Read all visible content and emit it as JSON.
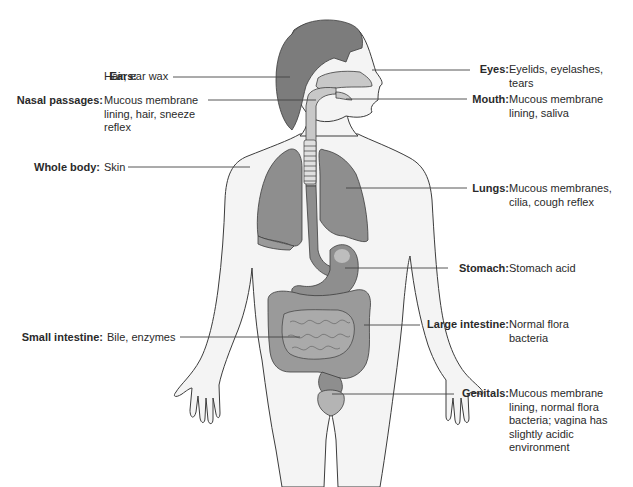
{
  "diagram": {
    "colors": {
      "skin": "#f4f4f4",
      "outline": "#3c3c3c",
      "hair": "#7c7c7c",
      "organ": "#8e8e8e",
      "airway": "#c8c8c8",
      "leader": "#444444"
    },
    "labels": {
      "ears": {
        "term": "Ears:",
        "desc": "Hair, ear wax"
      },
      "nasal": {
        "term": "Nasal passages:",
        "desc": "Mucous membrane\nlining, hair, sneeze\nreflex"
      },
      "whole_body": {
        "term": "Whole body:",
        "desc": "Skin"
      },
      "small_intestine": {
        "term": "Small intestine:",
        "desc": "Bile, enzymes"
      },
      "eyes": {
        "term": "Eyes:",
        "desc": "Eyelids, eyelashes,\ntears"
      },
      "mouth": {
        "term": "Mouth:",
        "desc": "Mucous membrane\nlining, saliva"
      },
      "lungs": {
        "term": "Lungs:",
        "desc": "Mucous membranes,\ncilia, cough reflex"
      },
      "stomach": {
        "term": "Stomach:",
        "desc": "Stomach acid"
      },
      "large_intestine": {
        "term": "Large intestine:",
        "desc": "Normal flora\nbacteria"
      },
      "genitals": {
        "term": "Genitals:",
        "desc": "Mucous membrane\nlining, normal flora\nbacteria; vagina has\nslightly acidic\nenvironment"
      }
    }
  }
}
